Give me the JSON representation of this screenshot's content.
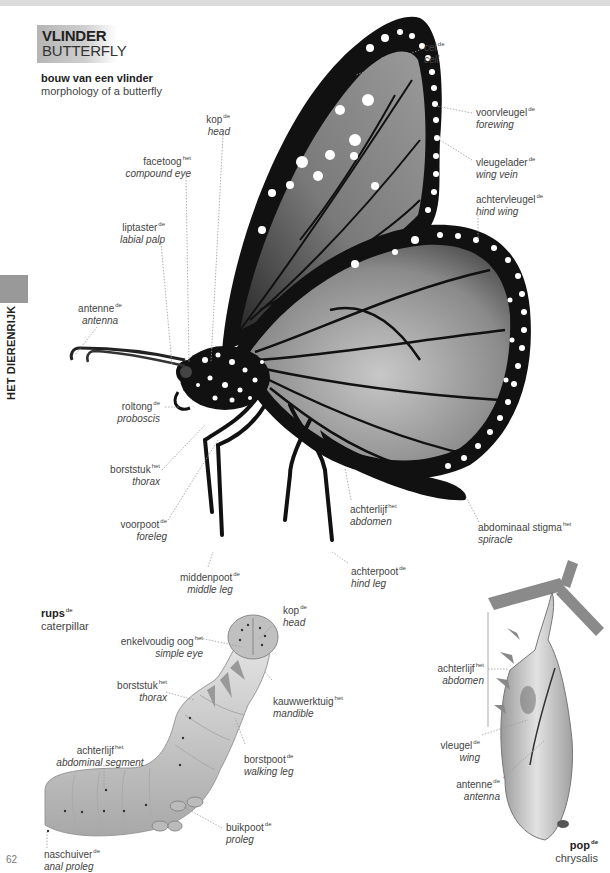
{
  "page": {
    "title_nl": "VLINDER",
    "title_en": "BUTTERFLY",
    "side_tab": "HET DIERENRIJK",
    "page_number": "62"
  },
  "butterfly": {
    "heading_nl": "bouw van een vlinder",
    "heading_en": "morphology of a butterfly",
    "labels": [
      {
        "id": "cel",
        "nl": "cel",
        "article": "de",
        "en": "cell"
      },
      {
        "id": "voorvleugel",
        "nl": "voorvleugel",
        "article": "de",
        "en": "forewing"
      },
      {
        "id": "vleugelader",
        "nl": "vleugelader",
        "article": "de",
        "en": "wing vein"
      },
      {
        "id": "achtervleugel",
        "nl": "achtervleugel",
        "article": "de",
        "en": "hind wing"
      },
      {
        "id": "kop",
        "nl": "kop",
        "article": "de",
        "en": "head"
      },
      {
        "id": "facetoog",
        "nl": "facetoog",
        "article": "het",
        "en": "compound eye"
      },
      {
        "id": "liptaster",
        "nl": "liptaster",
        "article": "de",
        "en": "labial palp"
      },
      {
        "id": "antenne",
        "nl": "antenne",
        "article": "de",
        "en": "antenna"
      },
      {
        "id": "roltong",
        "nl": "roltong",
        "article": "de",
        "en": "proboscis"
      },
      {
        "id": "borststuk",
        "nl": "borststuk",
        "article": "het",
        "en": "thorax"
      },
      {
        "id": "voorpoot",
        "nl": "voorpoot",
        "article": "de",
        "en": "foreleg"
      },
      {
        "id": "middenpoot",
        "nl": "middenpoot",
        "article": "de",
        "en": "middle leg"
      },
      {
        "id": "achterlijf",
        "nl": "achterlijf",
        "article": "het",
        "en": "abdomen"
      },
      {
        "id": "achterpoot",
        "nl": "achterpoot",
        "article": "de",
        "en": "hind leg"
      },
      {
        "id": "stigma",
        "nl": "abdominaal stigma",
        "article": "het",
        "en": "spiracle"
      }
    ]
  },
  "caterpillar": {
    "heading_nl": "rups",
    "heading_article": "de",
    "heading_en": "caterpillar",
    "labels": [
      {
        "id": "kop",
        "nl": "kop",
        "article": "de",
        "en": "head"
      },
      {
        "id": "enkelvoudig-oog",
        "nl": "enkelvoudig oog",
        "article": "het",
        "en": "simple eye"
      },
      {
        "id": "borststuk",
        "nl": "borststuk",
        "article": "het",
        "en": "thorax"
      },
      {
        "id": "kauwwerktuig",
        "nl": "kauwwerktuig",
        "article": "het",
        "en": "mandible"
      },
      {
        "id": "achterlijf",
        "nl": "achterlijf",
        "article": "het",
        "en": "abdominal segment"
      },
      {
        "id": "borstpoot",
        "nl": "borstpoot",
        "article": "de",
        "en": "walking leg"
      },
      {
        "id": "buikpoot",
        "nl": "buikpoot",
        "article": "de",
        "en": "proleg"
      },
      {
        "id": "naschuiver",
        "nl": "naschuiver",
        "article": "de",
        "en": "anal proleg"
      }
    ]
  },
  "chrysalis": {
    "heading_nl": "pop",
    "heading_article": "de",
    "heading_en": "chrysalis",
    "labels": [
      {
        "id": "achterlijf",
        "nl": "achterlijf",
        "article": "het",
        "en": "abdomen"
      },
      {
        "id": "vleugel",
        "nl": "vleugel",
        "article": "de",
        "en": "wing"
      },
      {
        "id": "antenne",
        "nl": "antenne",
        "article": "de",
        "en": "antenna"
      }
    ]
  }
}
